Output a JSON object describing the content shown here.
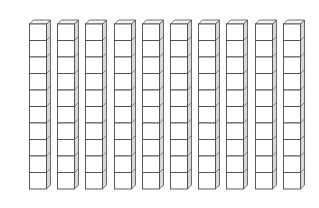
{
  "figure": {
    "description": "Base-ten blocks: ten rods of ten unit cubes",
    "rods": 10,
    "cubes_per_rod": 10,
    "total_cubes": 100,
    "colors": {
      "background": "#ffffff",
      "front_face": "#ffffff",
      "top_face": "#f4f4f4",
      "side_face": "#d8d8d8",
      "edge": "#4a4a4a"
    }
  }
}
